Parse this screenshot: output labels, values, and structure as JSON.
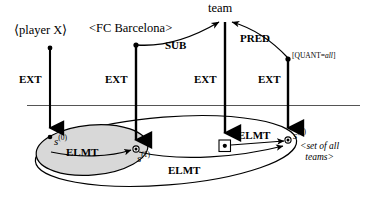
{
  "diagram": {
    "colors": {
      "stroke": "#000000",
      "rule_line": "#555555",
      "shaded_fill": "#d8d8d8",
      "background": "#ffffff"
    },
    "upper_nodes": [
      {
        "id": "player-x",
        "label": "⟨player X⟩"
      },
      {
        "id": "fc-barcelona",
        "label": "<FC Barcelona>"
      },
      {
        "id": "team",
        "label": "team"
      },
      {
        "id": "quant-all",
        "label": "[QUANT=",
        "italic": "all",
        "label_end": "]"
      }
    ],
    "arc_labels": [
      {
        "id": "sub",
        "label": "SUB"
      },
      {
        "id": "pred",
        "label": "PRED"
      }
    ],
    "ext_labels": [
      {
        "id": "ext-1",
        "label": "EXT"
      },
      {
        "id": "ext-2",
        "label": "EXT"
      },
      {
        "id": "ext-3",
        "label": "EXT"
      },
      {
        "id": "ext-4",
        "label": "EXT"
      }
    ],
    "elmt_labels": [
      {
        "id": "elmt-inner",
        "label": "ELMT"
      },
      {
        "id": "elmt-right",
        "label": "ELMT"
      },
      {
        "id": "elmt-outer",
        "label": "ELMT"
      }
    ],
    "instance_nodes": [
      {
        "id": "s0",
        "base": "s",
        "sup": "(0)"
      },
      {
        "id": "s1",
        "base": "s",
        "sup": "(1)"
      },
      {
        "id": "s2",
        "base": "s",
        "sup": "(2)"
      }
    ],
    "set_gloss": {
      "line1": "<set of all",
      "line2": "teams>"
    }
  }
}
